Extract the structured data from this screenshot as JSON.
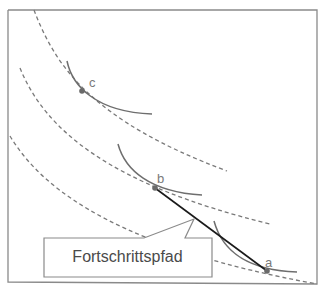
{
  "diagram": {
    "type": "indifference-curves-progress-path",
    "points": [
      {
        "id": "c",
        "label": "c"
      },
      {
        "id": "b",
        "label": "b"
      },
      {
        "id": "a",
        "label": "a"
      }
    ],
    "callout": {
      "label": "Fortschrittspfad"
    },
    "colors": {
      "frame": "#8a8a8a",
      "dashed_curve": "#7a7a7a",
      "solid_curve": "#6e6e6e",
      "path_line": "#1a1a1a",
      "point": "#6a6a6a",
      "label_text": "#7a7a7a",
      "callout_text": "#4a4a4a"
    }
  }
}
